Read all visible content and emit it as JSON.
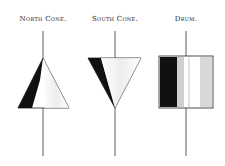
{
  "figure": {
    "labels": {
      "north_cone": "North Cone.",
      "south_cone": "South Cone.",
      "drum": "Drum."
    },
    "colors": {
      "ink": "#1a1a1a",
      "paper": "#ffffff",
      "shade": "#d8d8d8"
    }
  }
}
